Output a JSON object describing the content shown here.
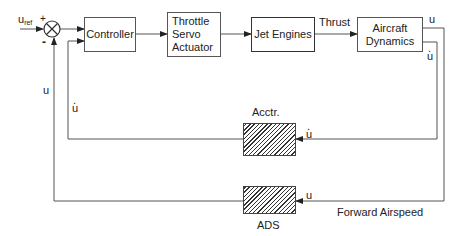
{
  "diagram": {
    "type": "block_diagram",
    "input": {
      "label_main": "u",
      "label_sub": "ref"
    },
    "summing_junction": {
      "plus_sign": "+",
      "minus_sign": "-"
    },
    "blocks": [
      {
        "id": "controller",
        "label": "Controller"
      },
      {
        "id": "throttle",
        "label_lines": [
          "Throttle",
          "Servo",
          "Actuator"
        ]
      },
      {
        "id": "jet_engines",
        "label": "Jet Engines"
      },
      {
        "id": "aircraft",
        "label_lines": [
          "Aircraft",
          "Dynamics"
        ]
      },
      {
        "id": "acctr",
        "label": "Acctr.",
        "style": "hatched"
      },
      {
        "id": "ads",
        "label": "ADS",
        "style": "hatched"
      }
    ],
    "signals": {
      "thrust": "Thrust",
      "u_out": "u",
      "udot_out": "u",
      "udot_feedback": "u",
      "u_feedback": "u",
      "udot_controller": "u",
      "u_sum": "u",
      "forward_airspeed": "Forward Airspeed"
    },
    "colors": {
      "line": "#444444",
      "text": "#222222"
    }
  }
}
